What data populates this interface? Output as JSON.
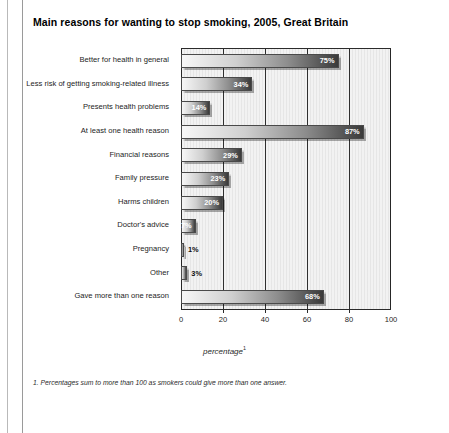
{
  "chart_data": {
    "type": "bar",
    "orientation": "horizontal",
    "title": "Main reasons for wanting to stop smoking, 2005, Great Britain",
    "xlabel": "percentage",
    "xlabel_footnote_marker": "1",
    "ylabel": "",
    "xlim": [
      0,
      100
    ],
    "xticks": [
      0,
      20,
      40,
      60,
      80,
      100
    ],
    "xtick_labels": [
      "0",
      "20",
      "40",
      "60",
      "80",
      "100"
    ],
    "grid": "vertical",
    "legend": "none",
    "categories": [
      "Better for health in general",
      "Less risk of getting smoking-related illness",
      "Presents health problems",
      "At least one health reason",
      "Financial reasons",
      "Family pressure",
      "Harms children",
      "Doctor's advice",
      "Pregnancy",
      "Other",
      "Gave more than one reason"
    ],
    "values": [
      75,
      34,
      14,
      87,
      29,
      23,
      20,
      7,
      1,
      3,
      68
    ],
    "value_labels": [
      "75%",
      "34%",
      "14%",
      "87%",
      "29%",
      "23%",
      "20%",
      "7%",
      "1%",
      "3%",
      "68%"
    ],
    "label_placement": [
      "inside",
      "inside",
      "inside",
      "inside",
      "inside",
      "inside",
      "inside",
      "inside",
      "outside",
      "outside",
      "inside"
    ],
    "footnote": "1. Percentages sum to more than 100 as smokers could give more than one answer."
  },
  "colors": {
    "bar_gradient_start": "#f7f7f7",
    "bar_gradient_end": "#3a3a3a",
    "plot_background": "#f2f2f2",
    "axis": "#2b2b2b",
    "text": "#1a1a1a"
  }
}
